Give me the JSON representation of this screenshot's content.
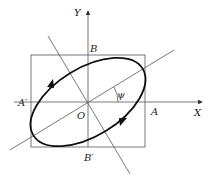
{
  "diagram": {
    "type": "polarization-ellipse",
    "labels": {
      "y_axis": "Y",
      "x_axis": "X",
      "point_b": "B",
      "point_b_prime": "B′",
      "point_a": "A",
      "point_a_prime": "A′",
      "origin": "O",
      "angle": "ψ"
    },
    "colors": {
      "ellipse": "#111111",
      "lines": "#555555",
      "text": "#222222"
    }
  }
}
